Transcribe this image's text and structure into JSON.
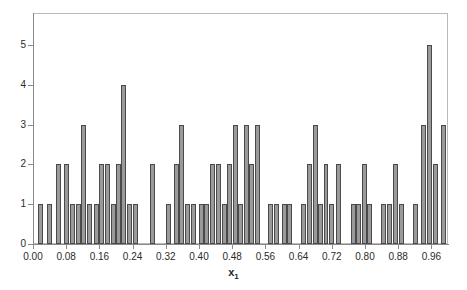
{
  "chart_data": {
    "type": "bar",
    "title": "",
    "subtitle": "",
    "xlabel": "x",
    "xlabel_subscript": "1",
    "ylabel": "",
    "xlim": [
      0.0,
      1.0
    ],
    "ylim": [
      0,
      5.8
    ],
    "grid": false,
    "legend": null,
    "bin_width": 0.01,
    "xticks": [
      "0.00",
      "0.08",
      "0.16",
      "0.24",
      "0.32",
      "0.40",
      "0.48",
      "0.56",
      "0.64",
      "0.72",
      "0.80",
      "0.88",
      "0.96"
    ],
    "xtick_values": [
      0.0,
      0.08,
      0.16,
      0.24,
      0.32,
      0.4,
      0.48,
      0.56,
      0.64,
      0.72,
      0.8,
      0.88,
      0.96
    ],
    "yticks": [
      "0",
      "1",
      "2",
      "3",
      "4",
      "5"
    ],
    "ytick_values": [
      0,
      1,
      2,
      3,
      4,
      5
    ],
    "bar_fill_color": "#9a9a9a",
    "bar_edge_color": "#4a4a4a",
    "axis_color": "#8a8a8a",
    "text_color": "#2b2b2b",
    "background_color": "#ffffff",
    "categories": [
      0.005,
      0.015,
      0.025,
      0.035,
      0.045,
      0.055,
      0.065,
      0.075,
      0.085,
      0.095,
      0.105,
      0.115,
      0.125,
      0.135,
      0.145,
      0.155,
      0.165,
      0.175,
      0.185,
      0.195,
      0.205,
      0.215,
      0.225,
      0.235,
      0.245,
      0.255,
      0.265,
      0.275,
      0.285,
      0.295,
      0.305,
      0.315,
      0.325,
      0.335,
      0.345,
      0.355,
      0.365,
      0.375,
      0.385,
      0.395,
      0.405,
      0.415,
      0.425,
      0.435,
      0.445,
      0.455,
      0.465,
      0.475,
      0.485,
      0.495,
      0.505,
      0.515,
      0.525,
      0.535,
      0.545,
      0.555,
      0.565,
      0.575,
      0.585,
      0.595,
      0.605,
      0.615,
      0.625,
      0.635,
      0.645,
      0.655,
      0.665,
      0.675,
      0.685,
      0.695,
      0.705,
      0.715,
      0.725,
      0.735,
      0.745,
      0.755,
      0.765,
      0.775,
      0.785,
      0.795,
      0.805,
      0.815,
      0.825,
      0.835,
      0.845,
      0.855,
      0.865,
      0.875,
      0.885,
      0.895,
      0.905,
      0.915,
      0.925,
      0.935,
      0.945,
      0.955,
      0.965,
      0.975,
      0.985,
      0.995
    ],
    "values": [
      0,
      1,
      1,
      0,
      1,
      1,
      0,
      0,
      2,
      2,
      0,
      2,
      2,
      0,
      1,
      1,
      3,
      3,
      1,
      1,
      0,
      1,
      1,
      2,
      2,
      2,
      2,
      1,
      1,
      2,
      2,
      4,
      4,
      1,
      1,
      0,
      0,
      1,
      1,
      0,
      0,
      0,
      2,
      2,
      0,
      0,
      0,
      1,
      1,
      2,
      2,
      3,
      3,
      0,
      1,
      1,
      1,
      1,
      2,
      2,
      1,
      1,
      2,
      2,
      0,
      3,
      3,
      1,
      1,
      3,
      3,
      2,
      3,
      3,
      0,
      1,
      1,
      1,
      1,
      0,
      1,
      1,
      0,
      2,
      2,
      3,
      3,
      1,
      1,
      2,
      2,
      2,
      2,
      1,
      1,
      1,
      1,
      0,
      1,
      1
    ],
    "bars": [
      {
        "x": 0.012,
        "w": 0.012,
        "h": 1
      },
      {
        "x": 0.034,
        "w": 0.012,
        "h": 1
      },
      {
        "x": 0.056,
        "w": 0.012,
        "h": 2
      },
      {
        "x": 0.074,
        "w": 0.012,
        "h": 2
      },
      {
        "x": 0.09,
        "w": 0.012,
        "h": 1
      },
      {
        "x": 0.103,
        "w": 0.012,
        "h": 1
      },
      {
        "x": 0.116,
        "w": 0.012,
        "h": 3
      },
      {
        "x": 0.13,
        "w": 0.012,
        "h": 1
      },
      {
        "x": 0.148,
        "w": 0.012,
        "h": 1
      },
      {
        "x": 0.16,
        "w": 0.012,
        "h": 2
      },
      {
        "x": 0.174,
        "w": 0.012,
        "h": 2
      },
      {
        "x": 0.187,
        "w": 0.012,
        "h": 1
      },
      {
        "x": 0.199,
        "w": 0.012,
        "h": 2
      },
      {
        "x": 0.211,
        "w": 0.012,
        "h": 4
      },
      {
        "x": 0.227,
        "w": 0.012,
        "h": 1
      },
      {
        "x": 0.24,
        "w": 0.012,
        "h": 1
      },
      {
        "x": 0.283,
        "w": 0.012,
        "h": 2
      },
      {
        "x": 0.32,
        "w": 0.012,
        "h": 1
      },
      {
        "x": 0.34,
        "w": 0.012,
        "h": 2
      },
      {
        "x": 0.352,
        "w": 0.012,
        "h": 3
      },
      {
        "x": 0.366,
        "w": 0.012,
        "h": 1
      },
      {
        "x": 0.38,
        "w": 0.012,
        "h": 1
      },
      {
        "x": 0.4,
        "w": 0.012,
        "h": 1
      },
      {
        "x": 0.413,
        "w": 0.012,
        "h": 1
      },
      {
        "x": 0.427,
        "w": 0.012,
        "h": 2
      },
      {
        "x": 0.441,
        "w": 0.012,
        "h": 2
      },
      {
        "x": 0.455,
        "w": 0.012,
        "h": 1
      },
      {
        "x": 0.468,
        "w": 0.012,
        "h": 2
      },
      {
        "x": 0.481,
        "w": 0.012,
        "h": 3
      },
      {
        "x": 0.495,
        "w": 0.012,
        "h": 1
      },
      {
        "x": 0.509,
        "w": 0.012,
        "h": 3
      },
      {
        "x": 0.521,
        "w": 0.012,
        "h": 2
      },
      {
        "x": 0.534,
        "w": 0.012,
        "h": 3
      },
      {
        "x": 0.566,
        "w": 0.012,
        "h": 1
      },
      {
        "x": 0.58,
        "w": 0.012,
        "h": 1
      },
      {
        "x": 0.6,
        "w": 0.012,
        "h": 1
      },
      {
        "x": 0.613,
        "w": 0.012,
        "h": 1
      },
      {
        "x": 0.645,
        "w": 0.012,
        "h": 1
      },
      {
        "x": 0.661,
        "w": 0.012,
        "h": 2
      },
      {
        "x": 0.674,
        "w": 0.012,
        "h": 3
      },
      {
        "x": 0.687,
        "w": 0.012,
        "h": 1
      },
      {
        "x": 0.7,
        "w": 0.012,
        "h": 2
      },
      {
        "x": 0.714,
        "w": 0.012,
        "h": 1
      },
      {
        "x": 0.731,
        "w": 0.012,
        "h": 2
      },
      {
        "x": 0.766,
        "w": 0.012,
        "h": 1
      },
      {
        "x": 0.779,
        "w": 0.012,
        "h": 1
      },
      {
        "x": 0.792,
        "w": 0.012,
        "h": 2
      },
      {
        "x": 0.805,
        "w": 0.012,
        "h": 1
      },
      {
        "x": 0.838,
        "w": 0.012,
        "h": 1
      },
      {
        "x": 0.852,
        "w": 0.012,
        "h": 1
      },
      {
        "x": 0.868,
        "w": 0.012,
        "h": 2
      },
      {
        "x": 0.882,
        "w": 0.012,
        "h": 1
      },
      {
        "x": 0.916,
        "w": 0.012,
        "h": 1
      },
      {
        "x": 0.936,
        "w": 0.012,
        "h": 3
      },
      {
        "x": 0.949,
        "w": 0.012,
        "h": 5
      },
      {
        "x": 0.963,
        "w": 0.012,
        "h": 2
      },
      {
        "x": 0.983,
        "w": 0.012,
        "h": 3
      }
    ]
  }
}
